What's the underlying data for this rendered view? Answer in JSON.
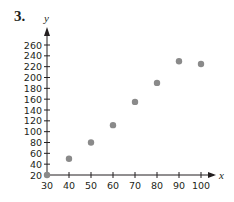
{
  "problem_number": "3.",
  "colors": {
    "axis": "#231f20",
    "point": "#8a8a8a"
  },
  "chart_data": {
    "type": "scatter",
    "title": "",
    "xlabel": "x",
    "ylabel": "y",
    "xlim": [
      30,
      100
    ],
    "ylim": [
      20,
      260
    ],
    "x_ticks": [
      30,
      40,
      50,
      60,
      70,
      80,
      90,
      100
    ],
    "y_ticks": [
      20,
      40,
      60,
      80,
      100,
      120,
      140,
      160,
      180,
      200,
      220,
      240,
      260
    ],
    "grid": false,
    "legend": null,
    "points": [
      {
        "x": 30,
        "y": 20
      },
      {
        "x": 40,
        "y": 50
      },
      {
        "x": 50,
        "y": 80
      },
      {
        "x": 60,
        "y": 112
      },
      {
        "x": 70,
        "y": 155
      },
      {
        "x": 80,
        "y": 190
      },
      {
        "x": 90,
        "y": 230
      },
      {
        "x": 100,
        "y": 225
      }
    ]
  }
}
